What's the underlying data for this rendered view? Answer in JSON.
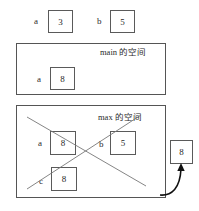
{
  "diagram": {
    "type": "memory-stack-frame-diagram",
    "background_color": "#ffffff",
    "line_color": "#555555",
    "text_color": "#2b2b2b"
  },
  "top_row": {
    "variables": [
      {
        "label": "a",
        "value": "3"
      },
      {
        "label": "b",
        "value": "5"
      }
    ]
  },
  "main_frame": {
    "title_name": "main",
    "title_suffix": "的空间",
    "variables": [
      {
        "label": "a",
        "value": "8"
      }
    ]
  },
  "max_frame": {
    "title_name": "max",
    "title_suffix": "的空间",
    "crossed_out": true,
    "variables": [
      {
        "label": "a",
        "value": "8"
      },
      {
        "label": "b",
        "value": "5"
      },
      {
        "label": "c",
        "value": "8"
      }
    ]
  },
  "return_value": {
    "value": "8",
    "arrow": "curved-arrow-up"
  }
}
